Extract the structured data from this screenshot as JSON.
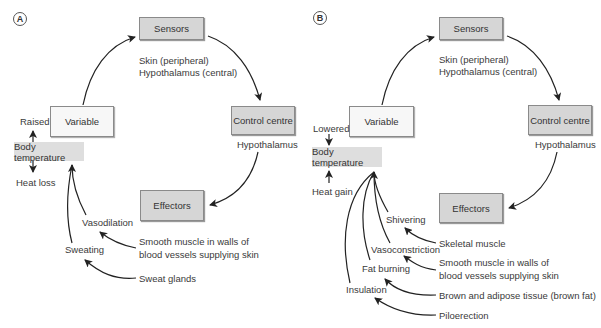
{
  "panels": [
    {
      "tag": "A",
      "sensors": {
        "label": "Sensors",
        "desc": [
          "Skin (peripheral)",
          "Hypothalamus (central)"
        ]
      },
      "control_centre": {
        "label": "Control centre",
        "desc": "Hypothalamus"
      },
      "effectors": {
        "label": "Effectors"
      },
      "variable": {
        "label": "Variable"
      },
      "body_temperature": {
        "label": "Body temperature",
        "change": "Raised",
        "result": "Heat loss"
      },
      "responses": [
        {
          "response": "Vasodilation",
          "effector": [
            "Smooth muscle in walls of",
            "blood vessels supplying skin"
          ]
        },
        {
          "response": "Sweating",
          "effector": [
            "Sweat glands"
          ]
        }
      ]
    },
    {
      "tag": "B",
      "sensors": {
        "label": "Sensors",
        "desc": [
          "Skin (peripheral)",
          "Hypothalamus (central)"
        ]
      },
      "control_centre": {
        "label": "Control centre",
        "desc": "Hypothalamus"
      },
      "effectors": {
        "label": "Effectors"
      },
      "variable": {
        "label": "Variable"
      },
      "body_temperature": {
        "label": "Body temperature",
        "change": "Lowered",
        "result": "Heat gain"
      },
      "responses": [
        {
          "response": "Shivering",
          "effector": [
            "Skeletal muscle"
          ]
        },
        {
          "response": "Vasoconstriction",
          "effector": [
            "Smooth muscle in walls of",
            "blood vessels supplying skin"
          ]
        },
        {
          "response": "Fat burning",
          "effector": [
            "Brown and adipose tissue (brown fat)"
          ]
        },
        {
          "response": "Insulation",
          "effector": [
            "Piloerection"
          ]
        }
      ]
    }
  ],
  "colors": {
    "dark_box": "#d6d6d6",
    "light_box": "#f7f7f7",
    "temp_box": "#dedede",
    "arrow": "#222222"
  }
}
